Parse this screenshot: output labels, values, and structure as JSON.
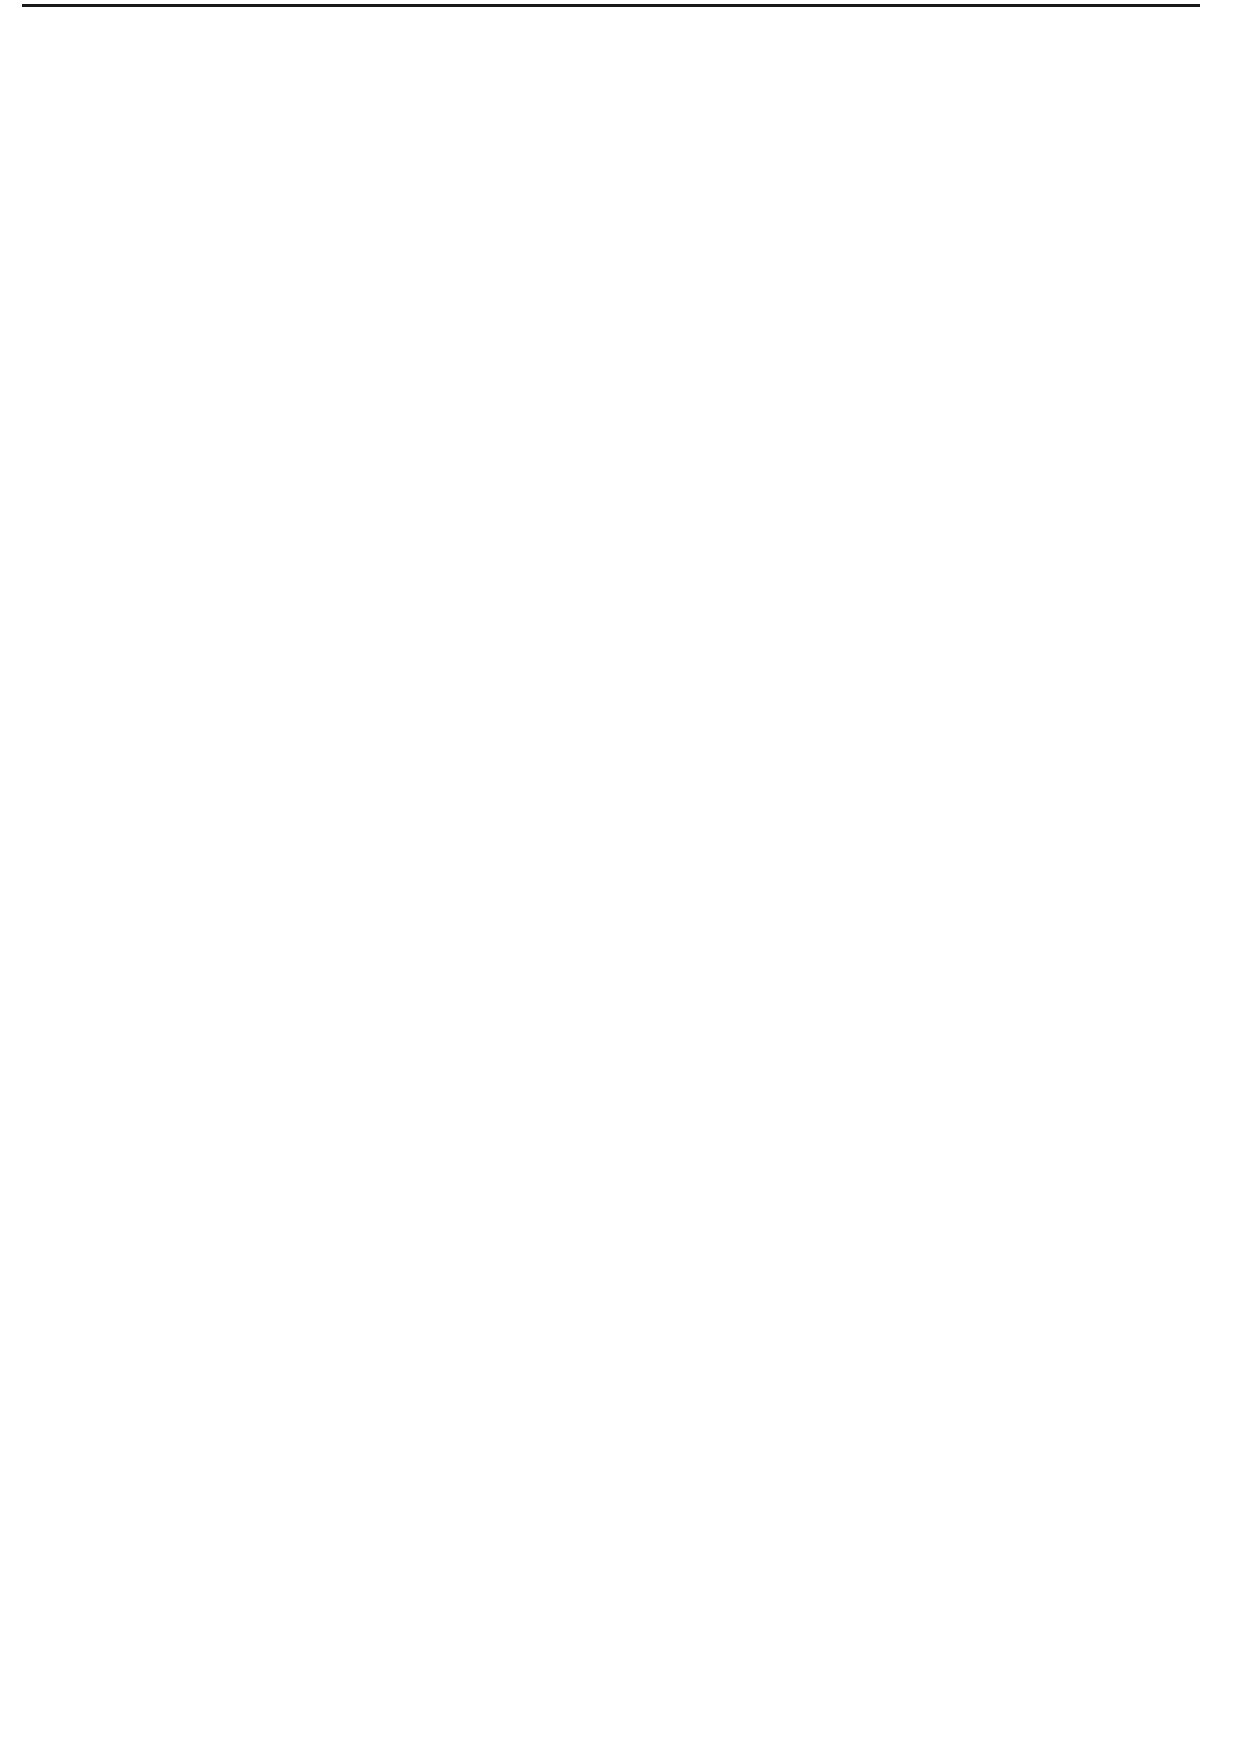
{
  "caption": "Falsified Hours and Salary",
  "nodes": [
    {
      "id": "root",
      "lines": [
        "Employee falsifies",
        "timekeeping and/or",
        "wage rate",
        "information"
      ]
    },
    {
      "id": "increase-rate",
      "lines": [
        "Increase rate",
        "of pay"
      ]
    },
    {
      "id": "manually-alter",
      "lines": [
        "Manually",
        "alter personnel",
        "records"
      ]
    },
    {
      "id": "unauthorized-codes",
      "lines": [
        "Unauthorized",
        "use of access",
        "codes"
      ]
    },
    {
      "id": "other-rate",
      "lines": [
        "Other"
      ]
    },
    {
      "id": "overstate-hours",
      "lines": [
        "Overstate hours"
      ]
    },
    {
      "id": "falsely-prepare",
      "lines": [
        "Falsely",
        "prepare",
        "manual",
        "timecards"
      ]
    },
    {
      "id": "alter-prepared",
      "lines": [
        "Alter prepared",
        "timecards"
      ]
    },
    {
      "id": "accomplice-punches",
      "lines": [
        "Accomplice",
        "punches",
        "timeclock",
        "for absent",
        "employee"
      ]
    },
    {
      "id": "leave-time",
      "lines": [
        "Leave time",
        "taken but not",
        "recorded"
      ]
    },
    {
      "id": "other-hours",
      "lines": [
        "Other"
      ]
    },
    {
      "id": "submit-timekeeping",
      "lines": [
        "Submit timekeeping",
        "information for",
        "approval"
      ]
    },
    {
      "id": "approves-own",
      "lines": [
        "Employee",
        "approves own",
        "timekeeping",
        "information"
      ]
    },
    {
      "id": "forge-signature",
      "lines": [
        "Forge",
        "signature of",
        "supervisor"
      ]
    },
    {
      "id": "conspires-supervisor",
      "lines": [
        "Employee",
        "conspires with",
        "supervisor"
      ]
    },
    {
      "id": "rubber-stamp",
      "lines": [
        "Supervisor",
        "gives \"rubber",
        "stamp\"",
        "approval"
      ]
    },
    {
      "id": "other-approval",
      "lines": [
        "Other"
      ]
    },
    {
      "id": "timesheet-sent",
      "lines": [
        "Timesheet sent to",
        "payroll department"
      ]
    },
    {
      "id": "paycheck-issued",
      "lines": [
        "Paycheck issued to",
        "the employee"
      ]
    },
    {
      "id": "coded-payroll",
      "lines": [
        "Coded to payroll",
        "account"
      ]
    }
  ],
  "edges": [
    {
      "from": "root",
      "to": "overstate-hours"
    },
    {
      "from": "root",
      "to": "increase-rate"
    },
    {
      "from": "increase-rate",
      "to": "manually-alter"
    },
    {
      "from": "increase-rate",
      "to": "unauthorized-codes"
    },
    {
      "from": "increase-rate",
      "to": "other-rate"
    },
    {
      "from": "overstate-hours",
      "to": "falsely-prepare"
    },
    {
      "from": "overstate-hours",
      "to": "alter-prepared"
    },
    {
      "from": "overstate-hours",
      "to": "accomplice-punches"
    },
    {
      "from": "overstate-hours",
      "to": "leave-time"
    },
    {
      "from": "overstate-hours",
      "to": "other-hours"
    },
    {
      "from": "falsely-prepare",
      "to": "submit-timekeeping"
    },
    {
      "from": "alter-prepared",
      "to": "submit-timekeeping"
    },
    {
      "from": "accomplice-punches",
      "to": "submit-timekeeping"
    },
    {
      "from": "leave-time",
      "to": "submit-timekeeping"
    },
    {
      "from": "other-hours",
      "to": "submit-timekeeping"
    },
    {
      "from": "submit-timekeeping",
      "to": "approves-own"
    },
    {
      "from": "submit-timekeeping",
      "to": "forge-signature"
    },
    {
      "from": "submit-timekeeping",
      "to": "conspires-supervisor"
    },
    {
      "from": "submit-timekeeping",
      "to": "rubber-stamp"
    },
    {
      "from": "submit-timekeeping",
      "to": "other-approval"
    },
    {
      "from": "approves-own",
      "to": "timesheet-sent"
    },
    {
      "from": "forge-signature",
      "to": "timesheet-sent"
    },
    {
      "from": "conspires-supervisor",
      "to": "timesheet-sent"
    },
    {
      "from": "rubber-stamp",
      "to": "timesheet-sent"
    },
    {
      "from": "other-approval",
      "to": "timesheet-sent"
    },
    {
      "from": "manually-alter",
      "to": "timesheet-sent"
    },
    {
      "from": "unauthorized-codes",
      "to": "timesheet-sent"
    },
    {
      "from": "other-rate",
      "to": "timesheet-sent"
    },
    {
      "from": "timesheet-sent",
      "to": "paycheck-issued"
    },
    {
      "from": "paycheck-issued",
      "to": "coded-payroll"
    }
  ]
}
